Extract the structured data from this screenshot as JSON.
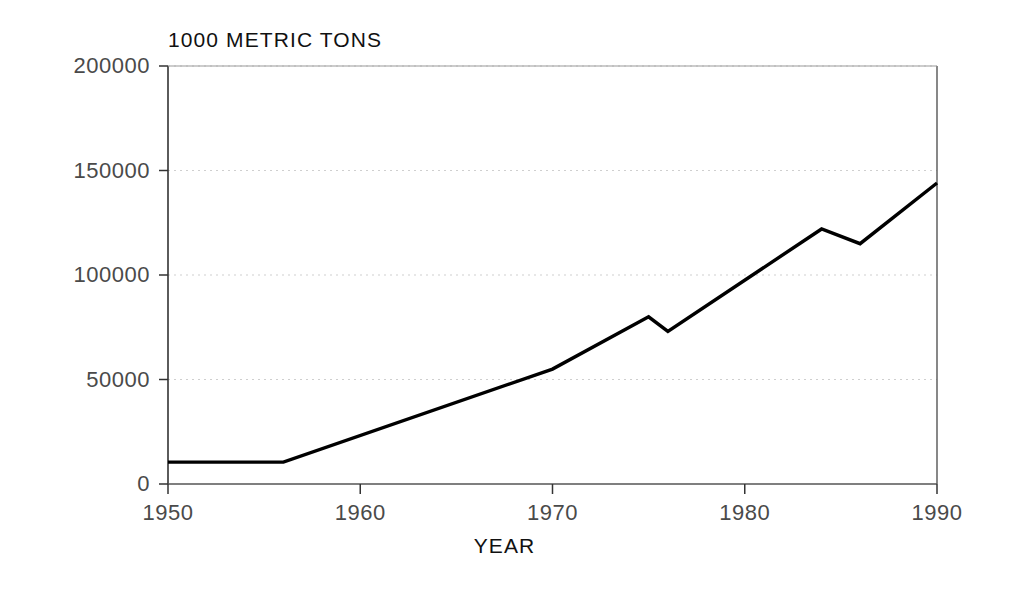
{
  "chart_data": {
    "type": "line",
    "title": "",
    "units_label": "1000 METRIC TONS",
    "xlabel": "YEAR",
    "ylabel": "",
    "xlim": [
      1950,
      1990
    ],
    "ylim": [
      0,
      200000
    ],
    "xticks": [
      1950,
      1960,
      1970,
      1980,
      1990
    ],
    "xtick_labels": [
      "1950",
      "1960",
      "1970",
      "1980",
      "1990"
    ],
    "yticks": [
      0,
      50000,
      100000,
      150000,
      200000
    ],
    "ytick_labels": [
      "0",
      "50000",
      "100000",
      "150000",
      "200000"
    ],
    "grid": "horizontal-dotted-faint",
    "legend": "none",
    "line_color": "#000000",
    "series": [
      {
        "name": "Production",
        "x": [
          1950,
          1956,
          1970,
          1975,
          1976,
          1984,
          1986,
          1990
        ],
        "values": [
          10500,
          10500,
          55000,
          80000,
          73000,
          122000,
          115000,
          144000
        ]
      }
    ]
  },
  "axes": {
    "units_label": "1000 METRIC TONS",
    "xlabel": "YEAR",
    "x_tick_labels": [
      "1950",
      "1960",
      "1970",
      "1980",
      "1990"
    ],
    "y_tick_labels": [
      "0",
      "50000",
      "100000",
      "150000",
      "200000"
    ]
  }
}
